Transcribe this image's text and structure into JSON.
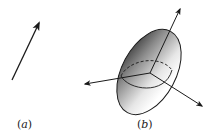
{
  "figure": {
    "panels": [
      {
        "id": "a",
        "label_open": "(",
        "label_letter": "a",
        "label_close": ")",
        "content": "single vector arrow"
      },
      {
        "id": "b",
        "label_open": "(",
        "label_letter": "b",
        "label_close": ")",
        "content": "shaded ellipsoid with three principal axes"
      }
    ]
  },
  "colors": {
    "stroke": "#1a1a1a",
    "shade_dark": "#3a3a3a",
    "shade_light": "#ffffff",
    "background": "#ffffff"
  }
}
